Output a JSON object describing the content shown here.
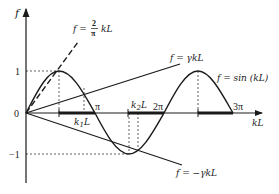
{
  "figure": {
    "axis_labels": {
      "y": "f",
      "x": "kL"
    },
    "y_ticks": {
      "one": "1",
      "zero": "0",
      "minus_one": "−1"
    },
    "x_ticks": {
      "pi": "π",
      "two_pi": "2π",
      "three_pi": "3π"
    },
    "segment_labels": {
      "k1": "k",
      "k1_sub": "1",
      "k1_L": "L",
      "k2": "k",
      "k2_sub": "2",
      "k2_L": "L"
    },
    "curve_labels": {
      "dashed_prefix": "f =",
      "dashed_num": "2",
      "dashed_den": "π",
      "dashed_suffix": "kL",
      "gamma": "f = γkL",
      "neg_gamma": "f = −γkL",
      "sine": "f = sin (kL)"
    },
    "colors": {
      "ink": "#1a1a1a",
      "background": "#ffffff"
    }
  }
}
